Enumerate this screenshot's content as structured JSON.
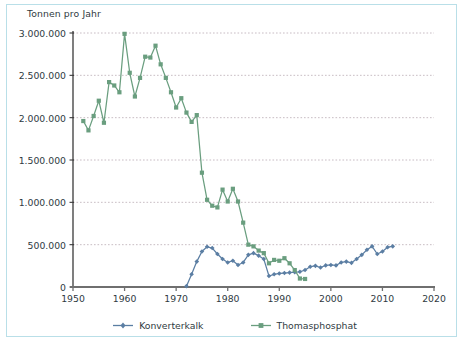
{
  "chart_data": {
    "type": "line",
    "title": "",
    "ylabel": "Tonnen pro Jahr",
    "xlabel": "",
    "xlim": [
      1950,
      2020
    ],
    "ylim": [
      0,
      3000000
    ],
    "grid": true,
    "legend_position": "bottom",
    "yticks": [
      "0",
      "500.000",
      "1.000.000",
      "1.500.000",
      "2.000.000",
      "2.500.000",
      "3.000.000"
    ],
    "ytick_values": [
      0,
      500000,
      1000000,
      1500000,
      2000000,
      2500000,
      3000000
    ],
    "xticks": [
      "1950",
      "1960",
      "1970",
      "1980",
      "1990",
      "2000",
      "2010",
      "2020"
    ],
    "xtick_values": [
      1950,
      1960,
      1970,
      1980,
      1990,
      2000,
      2010,
      2020
    ],
    "series": [
      {
        "name": "Konverterkalk",
        "color": "#5b7ea3",
        "marker": "diamond",
        "x": [
          1972,
          1973,
          1974,
          1975,
          1976,
          1977,
          1978,
          1979,
          1980,
          1981,
          1982,
          1983,
          1984,
          1985,
          1986,
          1987,
          1988,
          1989,
          1990,
          1991,
          1992,
          1993,
          1994,
          1995,
          1996,
          1997,
          1998,
          1999,
          2000,
          2001,
          2002,
          2003,
          2004,
          2005,
          2006,
          2007,
          2008,
          2009,
          2010,
          2011,
          2012
        ],
        "values": [
          10000,
          150000,
          300000,
          420000,
          475000,
          460000,
          390000,
          330000,
          290000,
          310000,
          260000,
          290000,
          380000,
          400000,
          370000,
          330000,
          130000,
          150000,
          160000,
          165000,
          170000,
          175000,
          180000,
          200000,
          240000,
          250000,
          230000,
          255000,
          260000,
          255000,
          290000,
          300000,
          285000,
          330000,
          380000,
          440000,
          480000,
          390000,
          420000,
          470000,
          480000
        ]
      },
      {
        "name": "Thomasphosphat",
        "color": "#6a9e7f",
        "marker": "square",
        "x": [
          1952,
          1953,
          1954,
          1955,
          1956,
          1957,
          1958,
          1959,
          1960,
          1961,
          1962,
          1963,
          1964,
          1965,
          1966,
          1967,
          1968,
          1969,
          1970,
          1971,
          1972,
          1973,
          1974,
          1975,
          1976,
          1977,
          1978,
          1979,
          1980,
          1981,
          1982,
          1983,
          1984,
          1985,
          1986,
          1987,
          1988,
          1989,
          1990,
          1991,
          1992,
          1993,
          1994,
          1995
        ],
        "values": [
          1960000,
          1850000,
          2020000,
          2200000,
          1940000,
          2420000,
          2380000,
          2300000,
          2990000,
          2530000,
          2250000,
          2470000,
          2720000,
          2710000,
          2850000,
          2630000,
          2470000,
          2300000,
          2120000,
          2230000,
          2060000,
          1950000,
          2030000,
          1350000,
          1030000,
          960000,
          940000,
          1150000,
          1010000,
          1160000,
          1010000,
          760000,
          500000,
          480000,
          430000,
          400000,
          280000,
          320000,
          310000,
          340000,
          280000,
          200000,
          100000,
          95000
        ]
      }
    ]
  },
  "legend": {
    "items": [
      {
        "label": "Konverterkalk",
        "color": "#5b7ea3"
      },
      {
        "label": "Thomasphosphat",
        "color": "#6a9e7f"
      }
    ]
  },
  "colors": {
    "frame": "#b9dfe8",
    "axis": "#6f6f6f",
    "grid": "#b0a0a8",
    "text": "#2f3a3f",
    "konverterkalk": "#5b7ea3",
    "thomasphosphat": "#6a9e7f"
  }
}
